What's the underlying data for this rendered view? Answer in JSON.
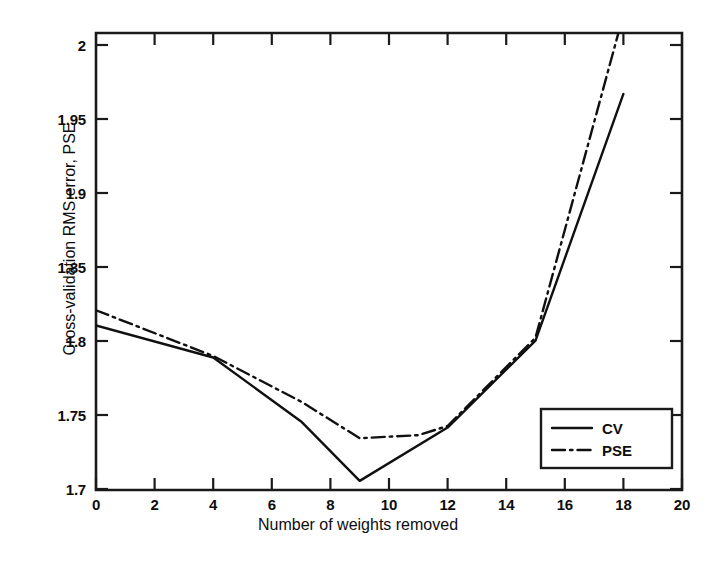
{
  "chart_data": {
    "type": "line",
    "title": "",
    "xlabel": "Number of weights removed",
    "ylabel": "Cross-validation RMS error, PSE",
    "xlim": [
      0,
      20
    ],
    "ylim": [
      1.7,
      2.0
    ],
    "xticks": [
      0,
      2,
      4,
      6,
      8,
      10,
      12,
      14,
      16,
      18,
      20
    ],
    "xtick_labels": [
      "0",
      "2",
      "4",
      "6",
      "8",
      "10",
      "12",
      "14",
      "16",
      "18",
      "20"
    ],
    "yticks": [
      1.7,
      1.75,
      1.8,
      1.85,
      1.9,
      1.95,
      2
    ],
    "ytick_labels": [
      "1.7",
      "1.75",
      "1.8",
      "1.85",
      "1.9",
      "1.95",
      "2"
    ],
    "grid": false,
    "legend_position": "lower right",
    "series": [
      {
        "name": "CV",
        "style": "solid",
        "color": "#101010",
        "x": [
          0,
          4,
          7,
          9,
          12,
          15,
          18
        ],
        "values": [
          1.808,
          1.787,
          1.745,
          1.706,
          1.741,
          1.798,
          1.96
        ]
      },
      {
        "name": "PSE",
        "style": "dash-dot",
        "color": "#101010",
        "x": [
          0,
          4,
          7,
          9,
          11,
          12,
          15,
          17.9
        ],
        "values": [
          1.818,
          1.788,
          1.758,
          1.734,
          1.736,
          1.742,
          1.8,
          2.005
        ]
      }
    ]
  },
  "legend": {
    "entries": [
      {
        "label": "CV"
      },
      {
        "label": "PSE"
      }
    ]
  },
  "ticks": {
    "y": [
      "2",
      "1.95",
      "1.9",
      "1.85",
      "1.8",
      "1.75",
      "1.7"
    ],
    "x": [
      "0",
      "2",
      "4",
      "6",
      "8",
      "10",
      "12",
      "14",
      "16",
      "18",
      "20"
    ]
  },
  "labels": {
    "x_title": "Number of weights removed",
    "y_title": "Cross-validation RMS error, PSE"
  }
}
